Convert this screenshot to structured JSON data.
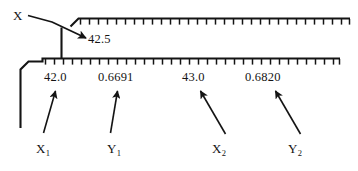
{
  "figure": {
    "type": "interpolation-scale-diagram",
    "background_color": "#ffffff",
    "ink_color": "#141414"
  },
  "pointer_label": {
    "text": "X",
    "target_value": "42.5"
  },
  "scales": [
    {
      "name": "upper-scale",
      "tick_count": 31,
      "orientation": "ticks-below-line"
    },
    {
      "name": "lower-scale",
      "tick_count": 31,
      "orientation": "ticks-below-line"
    }
  ],
  "callouts": {
    "interpolated_value": "42.5"
  },
  "values": [
    {
      "id": "x1",
      "value": "42.0",
      "variable": "X",
      "subscript": "1"
    },
    {
      "id": "y1",
      "value": "0.6691",
      "variable": "Y",
      "subscript": "1"
    },
    {
      "id": "x2",
      "value": "43.0",
      "variable": "X",
      "subscript": "2"
    },
    {
      "id": "y2",
      "value": "0.6820",
      "variable": "Y",
      "subscript": "2"
    }
  ],
  "arrows": [
    {
      "name": "x-pointer-arrow",
      "from": "X label",
      "to": "42.5 callout",
      "direction": "down-right"
    },
    {
      "name": "x1-pointer-arrow",
      "from": "X1 label",
      "to": "42.0 value",
      "direction": "up-right"
    },
    {
      "name": "y1-pointer-arrow",
      "from": "Y1 label",
      "to": "0.6691 value",
      "direction": "up-right"
    },
    {
      "name": "x2-pointer-arrow",
      "from": "X2 label",
      "to": "43.0 value",
      "direction": "up-left"
    },
    {
      "name": "y2-pointer-arrow",
      "from": "Y2 label",
      "to": "0.6820 value",
      "direction": "up-left"
    }
  ]
}
